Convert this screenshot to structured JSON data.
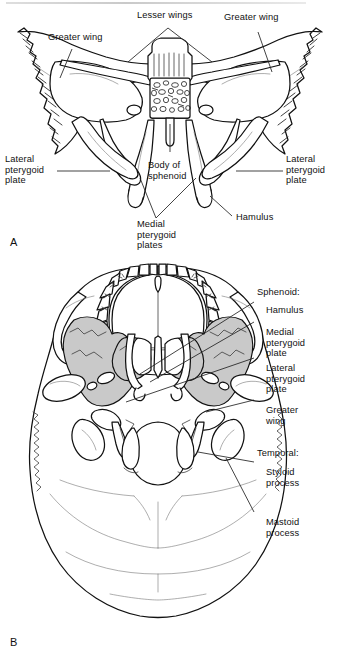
{
  "figure": {
    "background_color": "#ffffff",
    "ink_color": "#111111",
    "shade_color": "#c9c9c9"
  },
  "panels": [
    {
      "id": "A",
      "letter": "A",
      "view": "Sphenoid bone, posterior/anterior view (isolated bone)",
      "labels": [
        {
          "name": "greater-wing-left",
          "text": "Greater wing",
          "align": "left"
        },
        {
          "name": "lesser-wings",
          "text": "Lesser wings",
          "align": "left"
        },
        {
          "name": "greater-wing-right",
          "text": "Greater wing",
          "align": "left"
        },
        {
          "name": "lateral-pterygoid-left",
          "text": "Lateral\npterygoid\nplate",
          "align": "left"
        },
        {
          "name": "body-of-sphenoid",
          "text": "Body of\nsphenoid",
          "align": "left"
        },
        {
          "name": "lateral-pterygoid-right",
          "text": "Lateral\npterygoid\nplate",
          "align": "left"
        },
        {
          "name": "medial-pterygoid-plates",
          "text": "Medial\npterygoid\nplates",
          "align": "left"
        },
        {
          "name": "hamulus",
          "text": "Hamulus",
          "align": "left"
        }
      ]
    },
    {
      "id": "B",
      "letter": "B",
      "view": "Skull base, inferior view (norma basalis)",
      "labels": [
        {
          "name": "sphenoid-group-heading",
          "text": "Sphenoid:",
          "align": "left"
        },
        {
          "name": "hamulus",
          "text": "Hamulus",
          "align": "left"
        },
        {
          "name": "medial-pterygoid-plate",
          "text": "Medial\npterygoid\nplate",
          "align": "left"
        },
        {
          "name": "lateral-pterygoid-plate",
          "text": "Lateral\npterygoid\nplate",
          "align": "left"
        },
        {
          "name": "greater-wing",
          "text": "Greater\nwing",
          "align": "left"
        },
        {
          "name": "temporal-group-heading",
          "text": "Temporal:",
          "align": "left"
        },
        {
          "name": "styloid-process",
          "text": "Styloid\nprocess",
          "align": "left"
        },
        {
          "name": "mastoid-process",
          "text": "Mastoid\nprocess",
          "align": "left"
        }
      ]
    }
  ]
}
